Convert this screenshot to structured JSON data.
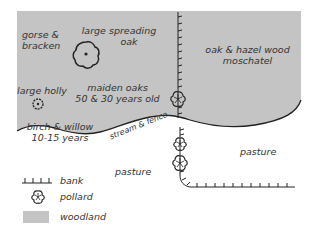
{
  "map": {
    "areas": {
      "gorse": {
        "line1": "gorse &",
        "line2": "bracken"
      },
      "spreading_oak": {
        "line1": "large spreading",
        "line2": "oak"
      },
      "holly": {
        "label": "large holly"
      },
      "maiden_oaks": {
        "line1": "maiden oaks",
        "line2": "50 & 30 years old"
      },
      "birch_willow": {
        "line1": "birch & willow",
        "line2": "10-15 years"
      },
      "oak_hazel": {
        "line1": "oak & hazel wood",
        "line2": "moschatel"
      },
      "stream": {
        "label": "stream & fence"
      },
      "pasture_left": {
        "label": "pasture"
      },
      "pasture_right": {
        "label": "pasture"
      }
    }
  },
  "legend": {
    "items": [
      {
        "icon": "bank-icon",
        "label": "bank"
      },
      {
        "icon": "pollard-icon",
        "label": "pollard"
      },
      {
        "icon": "woodland-swatch",
        "label": "woodland"
      }
    ]
  },
  "colors": {
    "woodland": "#c4c4c4",
    "ink": "#222222",
    "background": "#ffffff"
  }
}
